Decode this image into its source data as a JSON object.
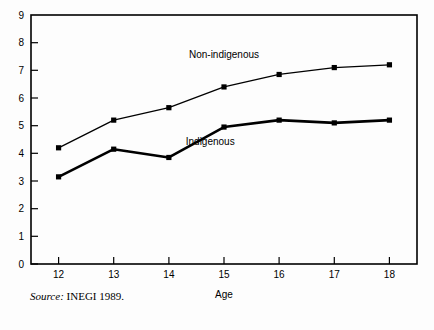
{
  "chart_data": {
    "type": "line",
    "title": "",
    "subtitle": "",
    "xlabel": "Age",
    "ylabel": "",
    "x": [
      12,
      13,
      14,
      15,
      16,
      17,
      18
    ],
    "categories": [
      "12",
      "13",
      "14",
      "15",
      "16",
      "17",
      "18"
    ],
    "xlim": [
      11.5,
      18.5
    ],
    "ylim": [
      0,
      9
    ],
    "xticks": [
      "12",
      "13",
      "14",
      "15",
      "16",
      "17",
      "18"
    ],
    "yticks": [
      "0",
      "1",
      "2",
      "3",
      "4",
      "5",
      "6",
      "7",
      "8",
      "9"
    ],
    "grid": false,
    "legend_position": "inline-annotation",
    "marker": "square",
    "series": [
      {
        "name": "Non-indigenous",
        "values": [
          4.2,
          5.2,
          5.65,
          6.4,
          6.85,
          7.1,
          7.2
        ],
        "color": "#000000",
        "label_x": 15.0,
        "label_y": 7.45
      },
      {
        "name": "Indigenous",
        "values": [
          3.15,
          4.15,
          3.85,
          4.95,
          5.2,
          5.1,
          5.2
        ],
        "color": "#000000",
        "label_x": 14.75,
        "label_y": 4.3
      }
    ],
    "annotations": [
      {
        "text": "Non-indigenous",
        "x": 15.0,
        "y": 7.45
      },
      {
        "text": "Indigenous",
        "x": 14.75,
        "y": 4.3
      }
    ]
  },
  "source": {
    "prefix": "Source:",
    "text": " INEGI 1989."
  },
  "axis": {
    "x_title": "Age"
  }
}
